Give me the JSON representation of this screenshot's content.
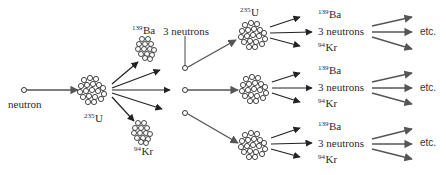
{
  "diagram": {
    "colors": {
      "arrow_dark": "#222222",
      "arrow_gray": "#555555",
      "nucleus_stroke": "#333333",
      "background": "#ffffff"
    },
    "labels": {
      "neutron": "neutron",
      "u235_initial": {
        "mass": "235",
        "symbol": "U"
      },
      "ba139_initial": {
        "mass": "139",
        "symbol": "Ba"
      },
      "kr94_initial": {
        "mass": "94",
        "symbol": "Kr"
      },
      "three_neutrons_initial": "3 neutrons",
      "u235_second": {
        "mass": "235",
        "symbol": "U"
      }
    },
    "branches": [
      {
        "ba": {
          "mass": "139",
          "symbol": "Ba"
        },
        "neutrons": "3 neutrons",
        "kr": {
          "mass": "94",
          "symbol": "Kr"
        },
        "continuation": "etc."
      },
      {
        "ba": {
          "mass": "139",
          "symbol": "Ba"
        },
        "neutrons": "3 neutrons",
        "kr": {
          "mass": "94",
          "symbol": "Kr"
        },
        "continuation": "etc."
      },
      {
        "ba": {
          "mass": "139",
          "symbol": "Ba"
        },
        "neutrons": "3 neutrons",
        "kr": {
          "mass": "94",
          "symbol": "Kr"
        },
        "continuation": "etc."
      }
    ]
  }
}
